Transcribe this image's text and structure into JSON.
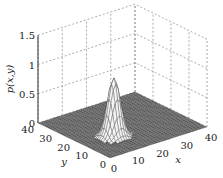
{
  "chart_data": {
    "type": "surface3d",
    "title": "",
    "xlabel": "x",
    "ylabel": "y",
    "zlabel": "p(x,y)",
    "x_range": [
      0,
      40
    ],
    "y_range": [
      0,
      40
    ],
    "zlim": [
      0,
      1.5
    ],
    "x_ticks": [
      "0",
      "10",
      "20",
      "30",
      "40"
    ],
    "y_ticks": [
      "0",
      "10",
      "20",
      "30",
      "40"
    ],
    "z_ticks": [
      "0",
      "0.5",
      "1",
      "1.5"
    ],
    "grid": true,
    "surface": {
      "description": "Single narrow Gaussian peak on a flat zero floor",
      "peak": {
        "x": 12,
        "y": 14,
        "z": 1.0
      },
      "spread": 2.2,
      "floor_value": 0,
      "floor_color": "#555555",
      "mesh_color": "#ffffff"
    }
  }
}
